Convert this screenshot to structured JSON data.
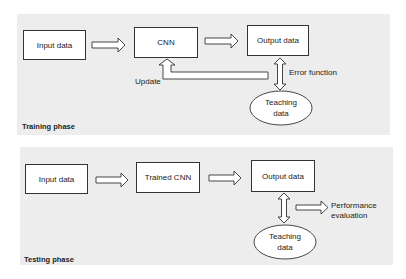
{
  "training": {
    "phase_label": "Training phase",
    "input_box": "Input data",
    "model_box": "CNN",
    "output_box": "Output data",
    "update_label": "Update",
    "error_label": "Error function",
    "teaching_line1": "Teaching",
    "teaching_line2": "data"
  },
  "testing": {
    "phase_label": "Testing phase",
    "input_box": "Input data",
    "model_box": "Trained CNN",
    "output_box": "Output data",
    "performance_line1": "Performance",
    "performance_line2": "evaluation",
    "teaching_line1": "Teaching",
    "teaching_line2": "data"
  },
  "colors": {
    "panel_bg": "#ededed",
    "stroke": "#333333",
    "box_fill": "#ffffff"
  }
}
